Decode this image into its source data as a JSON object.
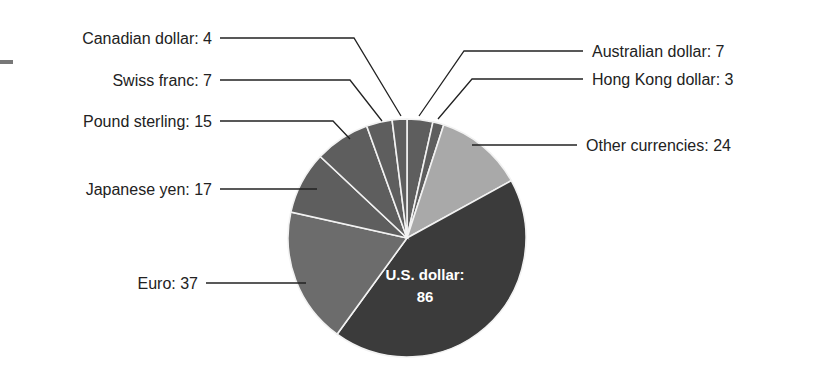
{
  "chart_data": {
    "type": "pie",
    "title": "",
    "unit": "",
    "total": 200,
    "start_angle_deg": 0,
    "direction": "clockwise",
    "slices": [
      {
        "name": "Australian dollar",
        "value": 7,
        "color": "#5e5e5e",
        "label": "Australian dollar: 7",
        "label_side": "right"
      },
      {
        "name": "Hong Kong dollar",
        "value": 3,
        "color": "#5e5e5e",
        "label": "Hong Kong dollar: 3",
        "label_side": "right"
      },
      {
        "name": "Other currencies",
        "value": 24,
        "color": "#a9a9a9",
        "label": "Other currencies: 24",
        "label_side": "right"
      },
      {
        "name": "U.S. dollar",
        "value": 86,
        "color": "#3b3b3b",
        "label": "U.S. dollar:",
        "label_line2": "86",
        "label_side": "inside"
      },
      {
        "name": "Euro",
        "value": 37,
        "color": "#6c6c6c",
        "label": "Euro: 37",
        "label_side": "left"
      },
      {
        "name": "Japanese yen",
        "value": 17,
        "color": "#5e5e5e",
        "label": "Japanese yen: 17",
        "label_side": "left"
      },
      {
        "name": "Pound sterling",
        "value": 15,
        "color": "#5e5e5e",
        "label": "Pound sterling: 15",
        "label_side": "left"
      },
      {
        "name": "Swiss franc",
        "value": 7,
        "color": "#5e5e5e",
        "label": "Swiss franc: 7",
        "label_side": "left"
      },
      {
        "name": "Canadian dollar",
        "value": 4,
        "color": "#5e5e5e",
        "label": "Canadian dollar: 4",
        "label_side": "left"
      }
    ],
    "legend": "none",
    "grid": false
  },
  "labels": {
    "canadian": "Canadian dollar: 4",
    "swiss": "Swiss franc: 7",
    "pound": "Pound sterling: 15",
    "yen": "Japanese yen: 17",
    "euro": "Euro: 37",
    "australian": "Australian dollar: 7",
    "hongkong": "Hong Kong dollar: 3",
    "other": "Other currencies: 24",
    "usd_line1": "U.S. dollar:",
    "usd_line2": "86"
  }
}
